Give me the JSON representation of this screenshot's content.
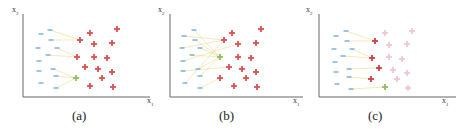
{
  "figure": {
    "panels": [
      {
        "id": "a",
        "caption": "(a)",
        "y_axis_label": "x",
        "y_axis_sub": "2",
        "x_axis_label": "x",
        "x_axis_sub": "1",
        "minus_color": "#5aa0d8",
        "plus_color": "#e05050",
        "highlight_color": "#8cc060",
        "line_color": "#f0d890",
        "minus_points": [
          [
            41,
            34
          ],
          [
            50,
            30
          ],
          [
            38,
            48
          ],
          [
            51,
            40
          ],
          [
            39,
            61
          ],
          [
            48,
            55
          ],
          [
            57,
            48
          ],
          [
            39,
            71
          ],
          [
            53,
            69
          ],
          [
            41,
            83
          ],
          [
            56,
            76
          ],
          [
            56,
            88
          ]
        ],
        "plus_points": [
          [
            90,
            33
          ],
          [
            80,
            40
          ],
          [
            117,
            29
          ],
          [
            94,
            44
          ],
          [
            112,
            43
          ],
          [
            77,
            57
          ],
          [
            94,
            57
          ],
          [
            107,
            58
          ],
          [
            85,
            67
          ],
          [
            98,
            69
          ],
          [
            112,
            72
          ],
          [
            102,
            78
          ],
          [
            90,
            86
          ],
          [
            113,
            87
          ]
        ],
        "faded_plus_points": [],
        "highlight_point": [
          76,
          78
        ],
        "lines": [
          [
            [
              50,
              30
            ],
            [
              80,
              40
            ]
          ],
          [
            [
              51,
              40
            ],
            [
              80,
              40
            ]
          ],
          [
            [
              57,
              48
            ],
            [
              77,
              57
            ]
          ],
          [
            [
              48,
              55
            ],
            [
              77,
              57
            ]
          ],
          [
            [
              56,
              76
            ],
            [
              76,
              78
            ]
          ],
          [
            [
              53,
              69
            ],
            [
              76,
              78
            ]
          ],
          [
            [
              56,
              88
            ],
            [
              76,
              78
            ]
          ]
        ]
      },
      {
        "id": "b",
        "caption": "(b)",
        "y_axis_label": "x",
        "y_axis_sub": "2",
        "x_axis_label": "x",
        "x_axis_sub": "1",
        "minus_color": "#5aa0d8",
        "plus_color": "#e05050",
        "highlight_color": "#8cc060",
        "line_color": "#f0d890",
        "minus_points": [
          [
            34,
            36
          ],
          [
            44,
            30
          ],
          [
            32,
            48
          ],
          [
            45,
            40
          ],
          [
            33,
            61
          ],
          [
            42,
            55
          ],
          [
            50,
            48
          ],
          [
            33,
            71
          ],
          [
            48,
            69
          ],
          [
            35,
            83
          ],
          [
            50,
            76
          ],
          [
            50,
            88
          ]
        ],
        "plus_points": [
          [
            82,
            33
          ],
          [
            74,
            40
          ],
          [
            111,
            29
          ],
          [
            88,
            44
          ],
          [
            106,
            43
          ],
          [
            88,
            57
          ],
          [
            101,
            58
          ],
          [
            79,
            67
          ],
          [
            92,
            69
          ],
          [
            106,
            72
          ],
          [
            96,
            78
          ],
          [
            70,
            78
          ],
          [
            84,
            86
          ],
          [
            107,
            87
          ]
        ],
        "faded_plus_points": [],
        "highlight_point": [
          70,
          57
        ],
        "lines": [
          [
            [
              44,
              30
            ],
            [
              70,
              57
            ]
          ],
          [
            [
              45,
              40
            ],
            [
              70,
              57
            ]
          ],
          [
            [
              50,
              48
            ],
            [
              70,
              57
            ]
          ],
          [
            [
              42,
              55
            ],
            [
              70,
              57
            ]
          ],
          [
            [
              48,
              69
            ],
            [
              70,
              57
            ]
          ],
          [
            [
              50,
              76
            ],
            [
              70,
              57
            ]
          ],
          [
            [
              34,
              36
            ],
            [
              74,
              40
            ]
          ],
          [
            [
              32,
              48
            ],
            [
              74,
              40
            ]
          ],
          [
            [
              33,
              61
            ],
            [
              88,
              44
            ]
          ],
          [
            [
              33,
              71
            ],
            [
              79,
              67
            ]
          ],
          [
            [
              35,
              83
            ],
            [
              74,
              40
            ]
          ],
          [
            [
              50,
              88
            ],
            [
              70,
              78
            ]
          ]
        ]
      },
      {
        "id": "c",
        "caption": "(c)",
        "y_axis_label": "x",
        "y_axis_sub": "2",
        "x_axis_label": "x",
        "x_axis_sub": "1",
        "minus_color": "#5aa0d8",
        "plus_color": "#d04040",
        "faded_plus_color": "#f2c8d0",
        "highlight_color": "#8cc060",
        "line_color": "#f0d890",
        "minus_points": [
          [
            30,
            36
          ],
          [
            40,
            31
          ],
          [
            28,
            49
          ],
          [
            41,
            41
          ],
          [
            29,
            62
          ],
          [
            37,
            56
          ],
          [
            46,
            49
          ],
          [
            30,
            72
          ],
          [
            43,
            69
          ],
          [
            31,
            84
          ],
          [
            43,
            77
          ],
          [
            45,
            89
          ]
        ],
        "plus_points": [
          [
            69,
            41
          ],
          [
            66,
            58
          ],
          [
            73,
            68
          ],
          [
            65,
            79
          ]
        ],
        "faded_plus_points": [
          [
            79,
            33
          ],
          [
            106,
            31
          ],
          [
            83,
            45
          ],
          [
            101,
            44
          ],
          [
            83,
            57
          ],
          [
            96,
            59
          ],
          [
            87,
            70
          ],
          [
            101,
            73
          ],
          [
            91,
            79
          ],
          [
            102,
            88
          ]
        ],
        "highlight_point": [
          79,
          87
        ],
        "lines": [
          [
            [
              40,
              31
            ],
            [
              69,
              41
            ]
          ],
          [
            [
              41,
              41
            ],
            [
              69,
              41
            ]
          ],
          [
            [
              46,
              49
            ],
            [
              66,
              58
            ]
          ],
          [
            [
              37,
              56
            ],
            [
              66,
              58
            ]
          ],
          [
            [
              43,
              69
            ],
            [
              73,
              68
            ]
          ],
          [
            [
              43,
              77
            ],
            [
              65,
              79
            ]
          ],
          [
            [
              45,
              89
            ],
            [
              79,
              87
            ]
          ]
        ]
      }
    ]
  }
}
